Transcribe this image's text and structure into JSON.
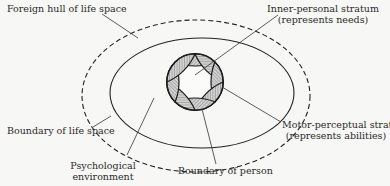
{
  "diagram": {
    "labels": {
      "foreign_hull": "Foreign hull of life space",
      "inner_personal_line1": "Inner-personal stratum",
      "inner_personal_line2": "(represents needs)",
      "boundary_life_space": "Boundary of life space",
      "motor_perceptual_line1": "Motor-perceptual stratum",
      "motor_perceptual_line2": "(represents abilities)",
      "psych_env_line1": "Psychological",
      "psych_env_line2": "environment",
      "boundary_person": "Boundary of person"
    },
    "colors": {
      "stroke": "#222222",
      "hatch_fill": "#b9b9b9",
      "background": "#f7f7f5"
    }
  }
}
